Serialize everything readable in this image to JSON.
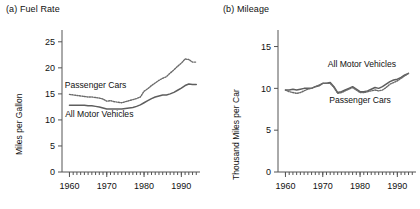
{
  "figure": {
    "background": "#ffffff",
    "solid_color": "#5e5e5e",
    "dotted_color": "#6a6a6a",
    "axis_color": "#555555"
  },
  "panels": [
    {
      "id": "a",
      "title": "(a)  Fuel Rate"
    },
    {
      "id": "b",
      "title": "(b)  Mileage"
    }
  ],
  "chart_data": [
    {
      "type": "line",
      "title": "(a)  Fuel Rate",
      "xlabel": "",
      "ylabel": "Miles per Gallon",
      "xlim": [
        1958,
        1995
      ],
      "ylim": [
        0,
        26.5
      ],
      "yticks": [
        0,
        5,
        10,
        15,
        20,
        25
      ],
      "ytick_labels": [
        "0",
        "5",
        "10",
        "15",
        "20",
        "25"
      ],
      "xticks": [
        1960,
        1970,
        1980,
        1990
      ],
      "xtick_labels": [
        "1960",
        "1970",
        "1980",
        "1990"
      ],
      "minor_xticks_every": 1,
      "grid": false,
      "legend": "in-plot annotations",
      "annotations": [
        {
          "text": "Passenger Cars",
          "x": 1967.0,
          "y": 16.2
        },
        {
          "text": "All Motor Vehicles",
          "x": 1968.0,
          "y": 10.6
        }
      ],
      "x": [
        1960,
        1961,
        1962,
        1963,
        1964,
        1965,
        1966,
        1967,
        1968,
        1969,
        1970,
        1971,
        1972,
        1973,
        1974,
        1975,
        1976,
        1977,
        1978,
        1979,
        1980,
        1981,
        1982,
        1983,
        1984,
        1985,
        1986,
        1987,
        1988,
        1989,
        1990,
        1991,
        1992,
        1993,
        1994
      ],
      "series": [
        {
          "name": "Passenger Cars",
          "style": "dotted",
          "values": [
            14.9,
            14.8,
            14.7,
            14.6,
            14.5,
            14.4,
            14.4,
            14.3,
            14.2,
            14.0,
            13.6,
            13.7,
            13.5,
            13.4,
            13.3,
            13.5,
            13.7,
            13.9,
            14.1,
            14.4,
            15.5,
            16.0,
            16.6,
            17.1,
            17.6,
            18.0,
            18.3,
            19.0,
            19.6,
            20.3,
            20.9,
            21.7,
            21.6,
            21.1,
            21.1
          ]
        },
        {
          "name": "All Motor Vehicles",
          "style": "solid",
          "values": [
            12.8,
            12.8,
            12.8,
            12.8,
            12.8,
            12.7,
            12.7,
            12.6,
            12.5,
            12.3,
            12.1,
            12.1,
            12.1,
            12.1,
            12.1,
            12.2,
            12.3,
            12.4,
            12.6,
            12.9,
            13.3,
            13.7,
            14.1,
            14.4,
            14.6,
            14.8,
            14.8,
            15.0,
            15.3,
            15.7,
            16.1,
            16.6,
            16.9,
            16.8,
            16.8
          ]
        }
      ]
    },
    {
      "type": "line",
      "title": "(b)  Mileage",
      "xlabel": "",
      "ylabel": "Thousand Miles per Car",
      "xlim": [
        1958,
        1995
      ],
      "ylim": [
        0,
        16.5
      ],
      "yticks": [
        0,
        5,
        10,
        15
      ],
      "ytick_labels": [
        "0",
        "5",
        "10",
        "15"
      ],
      "xticks": [
        1960,
        1970,
        1980,
        1990
      ],
      "xtick_labels": [
        "1960",
        "1970",
        "1980",
        "1990"
      ],
      "minor_xticks_every": 1,
      "grid": false,
      "legend": "in-plot annotations",
      "annotations": [
        {
          "text": "All Motor Vehicles",
          "x": 1980.5,
          "y": 12.6
        },
        {
          "text": "Passenger Cars",
          "x": 1980.0,
          "y": 8.3
        }
      ],
      "x": [
        1960,
        1961,
        1962,
        1963,
        1964,
        1965,
        1966,
        1967,
        1968,
        1969,
        1970,
        1971,
        1972,
        1973,
        1974,
        1975,
        1976,
        1977,
        1978,
        1979,
        1980,
        1981,
        1982,
        1983,
        1984,
        1985,
        1986,
        1987,
        1988,
        1989,
        1990,
        1991,
        1992,
        1993
      ],
      "series": [
        {
          "name": "All Motor Vehicles",
          "style": "solid",
          "values": [
            9.8,
            9.8,
            9.9,
            9.8,
            9.9,
            10.0,
            10.0,
            10.0,
            10.2,
            10.3,
            10.6,
            10.6,
            10.7,
            10.2,
            9.5,
            9.6,
            9.8,
            10.0,
            10.2,
            9.9,
            9.6,
            9.6,
            9.7,
            9.9,
            10.1,
            10.0,
            10.2,
            10.5,
            10.8,
            11.0,
            11.1,
            11.3,
            11.6,
            11.8
          ]
        },
        {
          "name": "Passenger Cars",
          "style": "dotted",
          "values": [
            9.8,
            9.6,
            9.5,
            9.4,
            9.5,
            9.7,
            9.9,
            10.0,
            10.2,
            10.4,
            10.6,
            10.6,
            10.6,
            10.1,
            9.4,
            9.5,
            9.7,
            9.9,
            10.1,
            9.8,
            9.5,
            9.5,
            9.6,
            9.7,
            9.8,
            9.7,
            9.8,
            10.1,
            10.5,
            10.7,
            10.9,
            11.2,
            11.5,
            11.8
          ]
        }
      ]
    }
  ]
}
